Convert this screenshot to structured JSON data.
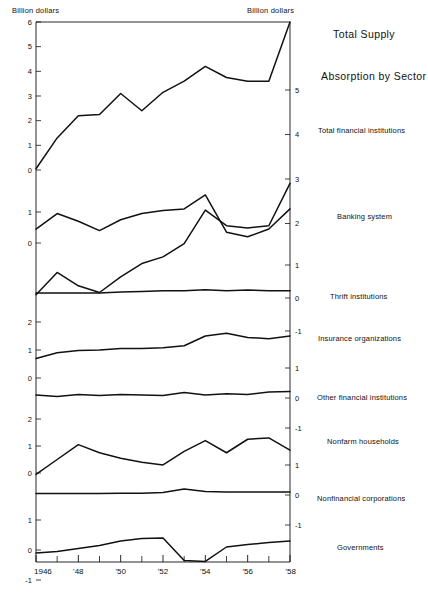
{
  "header": {
    "left_unit": "Billion dollars",
    "right_unit": "Billion dollars"
  },
  "titles": {
    "total_supply": "Total Supply",
    "absorption": "Absorption by Sector"
  },
  "series_labels": {
    "total_financial_institutions": "Total financial institutions",
    "banking_system": "Banking system",
    "thrift_institutions": "Thrift institutions",
    "insurance_organizations": "Insurance organizations",
    "other_financial_institutions": "Other financial institutions",
    "nonfarm_households": "Nonfarm households",
    "nonfinancial_corporations": "Nonfinancial corporations",
    "governments": "Governments"
  },
  "axes": {
    "x_tick_labels": [
      "1946",
      "'48",
      "'50",
      "'52",
      "'54",
      "'56",
      "'58"
    ],
    "x_tick_years": [
      1946,
      1948,
      1950,
      1952,
      1954,
      1956,
      1958
    ],
    "x_minor_years": [
      1947,
      1949,
      1951,
      1953,
      1955,
      1957
    ],
    "x_range": [
      1946,
      1958
    ],
    "left_ticks_panel1": [
      "6",
      "5",
      "4",
      "3",
      "2",
      "1",
      "0"
    ],
    "left_ticks_panel2": [
      "1",
      "0"
    ],
    "left_ticks_panel3": [
      "2",
      "1",
      "0"
    ],
    "left_ticks_panel4": [
      "2",
      "1",
      "0"
    ],
    "left_ticks_panel5": [
      "1",
      "0",
      "-1"
    ],
    "right_ticks_upper": [
      "5",
      "4",
      "3",
      "2"
    ],
    "right_ticks_mid": [
      "1",
      "0",
      "-1"
    ],
    "right_ticks_lower1": [
      "1",
      "0",
      "-1"
    ],
    "right_ticks_lower2": [
      "1",
      "0",
      "-1"
    ]
  },
  "chart_data": {
    "type": "line",
    "xlabel": "",
    "ylabel": "Billion dollars",
    "x": [
      1946,
      1947,
      1948,
      1949,
      1950,
      1951,
      1952,
      1953,
      1954,
      1955,
      1956,
      1957,
      1958
    ],
    "xlim": [
      1946,
      1958
    ],
    "grid": false,
    "legend": "right",
    "series": [
      {
        "name": "Total Supply",
        "values": [
          0.05,
          1.3,
          2.2,
          2.25,
          3.1,
          2.4,
          3.15,
          3.6,
          4.2,
          3.75,
          3.6,
          3.6,
          6.0
        ],
        "panel": 1,
        "axis": "left",
        "ylim": [
          0,
          6
        ]
      },
      {
        "name": "Total financial institutions",
        "values": [
          0.4,
          0.9,
          0.6,
          0.45,
          0.8,
          1.1,
          1.25,
          1.55,
          2.3,
          1.95,
          1.9,
          1.95,
          2.9
        ],
        "panel": 1,
        "axis": "right",
        "ylim": [
          1,
          5
        ]
      },
      {
        "name": "Banking system",
        "values": [
          0.45,
          0.95,
          0.7,
          0.4,
          0.75,
          0.95,
          1.05,
          1.1,
          1.55,
          0.35,
          0.2,
          0.45,
          1.1
        ],
        "panel": 2,
        "axis": "left",
        "ylim": [
          0,
          1
        ]
      },
      {
        "name": "Thrift institutions",
        "values": [
          0.15,
          0.15,
          0.15,
          0.15,
          0.18,
          0.2,
          0.22,
          0.22,
          0.25,
          0.22,
          0.24,
          0.22,
          0.22
        ],
        "panel": 3,
        "axis": "right",
        "ylim": [
          -1,
          1
        ]
      },
      {
        "name": "Insurance organizations",
        "values": [
          0.7,
          0.9,
          0.98,
          1.0,
          1.05,
          1.05,
          1.08,
          1.15,
          1.5,
          1.6,
          1.45,
          1.4,
          1.5
        ],
        "panel": 3,
        "axis": "left",
        "ylim": [
          0,
          2
        ]
      },
      {
        "name": "Other financial institutions",
        "values": [
          0.1,
          0.05,
          0.12,
          0.08,
          0.12,
          0.1,
          0.08,
          0.18,
          0.1,
          0.14,
          0.12,
          0.2,
          0.22
        ],
        "panel": 4,
        "axis": "right",
        "ylim": [
          -1,
          1
        ]
      },
      {
        "name": "Nonfarm households",
        "values": [
          -0.05,
          0.5,
          1.05,
          0.75,
          0.55,
          0.4,
          0.3,
          0.8,
          1.2,
          0.75,
          1.25,
          1.3,
          0.85
        ],
        "panel": 4,
        "axis": "left",
        "ylim": [
          0,
          2
        ]
      },
      {
        "name": "Nonfinancial corporations",
        "values": [
          0.05,
          0.05,
          0.05,
          0.05,
          0.06,
          0.06,
          0.08,
          0.2,
          0.12,
          0.1,
          0.1,
          0.1,
          0.1
        ],
        "panel": 5,
        "axis": "right",
        "ylim": [
          -1,
          1
        ]
      },
      {
        "name": "Governments",
        "values": [
          -0.1,
          -0.05,
          0.05,
          0.15,
          0.3,
          0.38,
          0.4,
          -0.35,
          -0.38,
          0.1,
          0.18,
          0.25,
          0.3
        ],
        "panel": 5,
        "axis": "left",
        "ylim": [
          -1,
          1
        ]
      }
    ]
  }
}
